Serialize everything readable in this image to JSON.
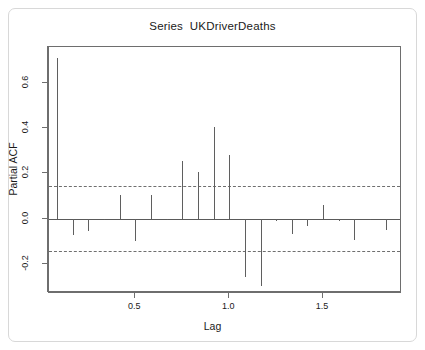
{
  "chart_data": {
    "type": "bar",
    "title": "Series  UKDriverDeaths",
    "xlabel": "Lag",
    "ylabel": "Partial ACF",
    "grid": false,
    "legend": null,
    "xlim": [
      0.04,
      1.92
    ],
    "ylim": [
      -0.33,
      0.76
    ],
    "xticks": [
      0.5,
      1.0,
      1.5
    ],
    "xtick_labels": [
      "0.5",
      "1.0",
      "1.5"
    ],
    "yticks": [
      -0.2,
      0.0,
      0.2,
      0.4,
      0.6
    ],
    "ytick_labels": [
      "-0.2",
      "0.0",
      "0.2",
      "0.4",
      "0.6"
    ],
    "zero_line": 0.0,
    "confidence_bounds": [
      0.145,
      -0.145
    ],
    "confidence_style": "dashed",
    "x": [
      0.0833,
      0.1667,
      0.25,
      0.3333,
      0.4167,
      0.5,
      0.5833,
      0.6667,
      0.75,
      0.8333,
      0.9167,
      1.0,
      1.0833,
      1.1667,
      1.25,
      1.3333,
      1.4167,
      1.5,
      1.5833,
      1.6667,
      1.75,
      1.8333
    ],
    "values": [
      0.71,
      -0.075,
      -0.055,
      -0.005,
      0.105,
      -0.1,
      0.105,
      -0.008,
      0.255,
      0.205,
      0.405,
      0.28,
      -0.26,
      -0.3,
      -0.012,
      -0.07,
      -0.035,
      0.06,
      -0.013,
      -0.095,
      -0.005,
      -0.05
    ]
  },
  "figure": {
    "title": "Series  UKDriverDeaths"
  }
}
